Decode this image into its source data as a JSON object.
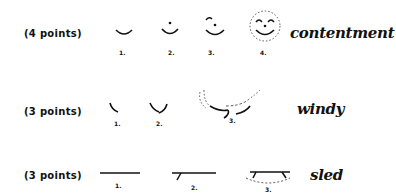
{
  "rows": [
    {
      "points_label": "(4 points)",
      "steps": [
        "1.",
        "2.",
        "3.",
        "4."
      ],
      "word": "contentment"
    },
    {
      "points_label": "(3 points)",
      "steps": [
        "1.",
        "2.",
        "3."
      ],
      "word": "windy"
    },
    {
      "points_label": "(3 points)",
      "steps": [
        "1.",
        "2.",
        "3."
      ],
      "word": "sled"
    }
  ]
}
